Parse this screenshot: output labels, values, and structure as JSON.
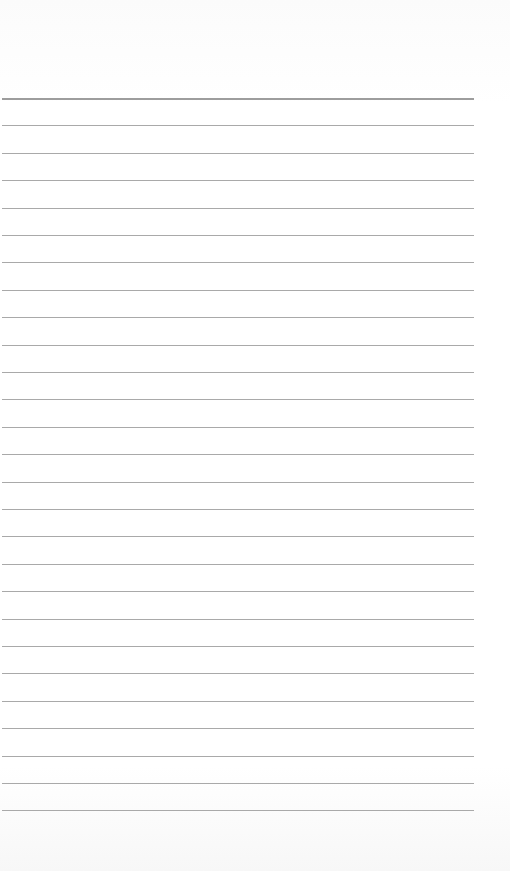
{
  "page": {
    "type": "lined-paper",
    "background_color": "#ffffff",
    "line_color": "#9a9a9a",
    "line_count": 27,
    "first_line_y": 98,
    "line_spacing": 27.4,
    "line_left": 2,
    "line_right": 474
  }
}
